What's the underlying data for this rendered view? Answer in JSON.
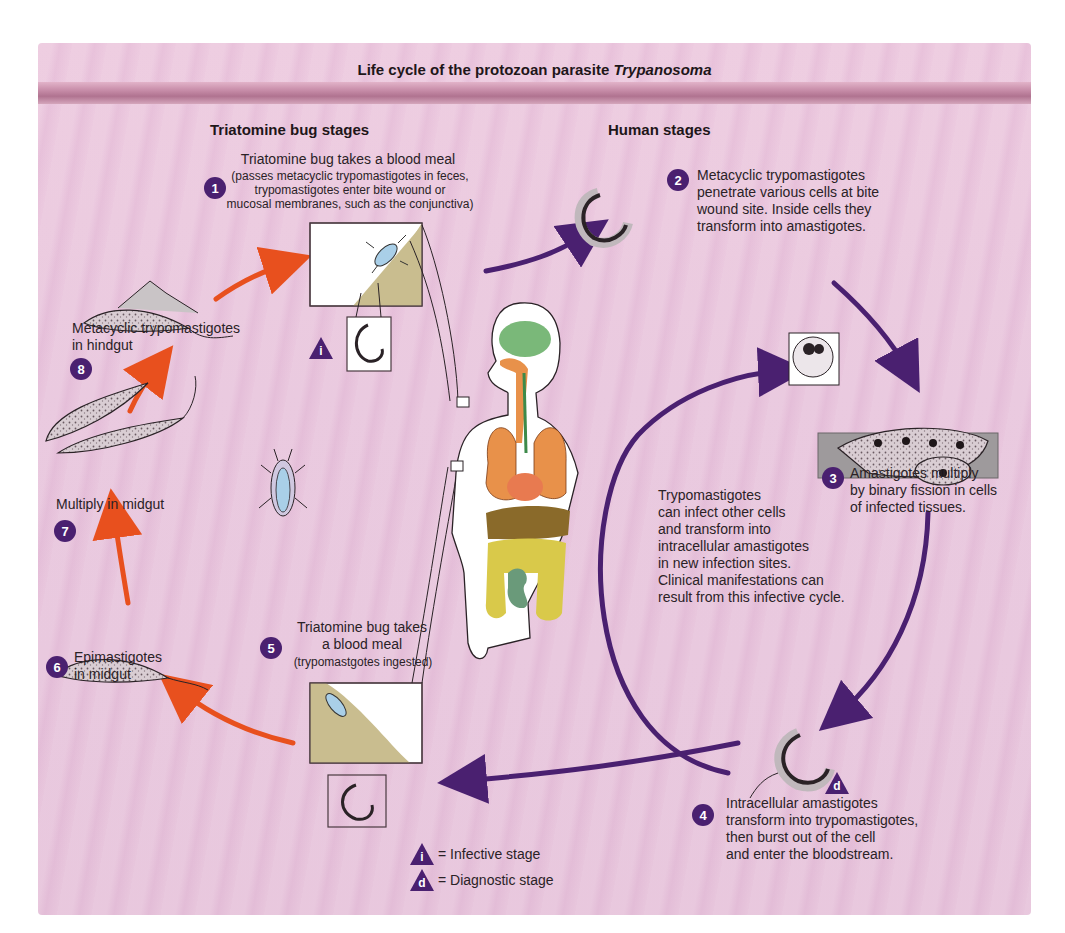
{
  "title": {
    "prefix": "Life cycle of the protozoan parasite ",
    "italic": "Trypanosoma"
  },
  "sections": {
    "left": "Triatomine bug stages",
    "right": "Human stages"
  },
  "stages": [
    {
      "number": "1",
      "heading": "Triatomine bug takes a blood meal",
      "detail_lines": [
        "(passes metacyclic trypomastigotes in feces,",
        "trypomastigotes enter bite wound or",
        "mucosal membranes, such as the conjunctiva)"
      ]
    },
    {
      "number": "2",
      "lines": [
        "Metacyclic trypomastigotes",
        "penetrate various cells at bite",
        "wound site. Inside cells they",
        "transform into amastigotes."
      ]
    },
    {
      "number": "3",
      "lines": [
        "Amastigotes multiply",
        "by binary fission in cells",
        "of infected tissues."
      ]
    },
    {
      "number": "4",
      "lines": [
        "Intracellular amastigotes",
        "transform into trypomastigotes,",
        "then burst out of the cell",
        "and enter the bloodstream."
      ]
    },
    {
      "number": "5",
      "lines": [
        "Triatomine bug takes",
        "a blood meal"
      ],
      "detail": "(trypomastgotes ingested)"
    },
    {
      "number": "6",
      "lines": [
        "Epimastigotes",
        "in midgut"
      ]
    },
    {
      "number": "7",
      "lines": [
        "Multiply in midgut"
      ]
    },
    {
      "number": "8",
      "lines": [
        "Metacyclic trypomastigotes",
        "in hindgut"
      ]
    }
  ],
  "inner_cycle_note": [
    "Trypomastigotes",
    "can infect other cells",
    "and transform into",
    "intracellular amastigotes",
    "in new infection sites.",
    "Clinical manifestations can",
    "result from this infective cycle."
  ],
  "markers": {
    "infective": "i",
    "diagnostic": "d"
  },
  "legend": [
    {
      "symbol": "i",
      "label": "= Infective stage"
    },
    {
      "symbol": "d",
      "label": "= Diagnostic stage"
    }
  ],
  "colors": {
    "background": "#e8c4dc",
    "band": "#b07390",
    "badge": "#4a2070",
    "human_arrow": "#4a2070",
    "bug_arrow": "#e8501e",
    "skin": "#c9bd8f"
  }
}
